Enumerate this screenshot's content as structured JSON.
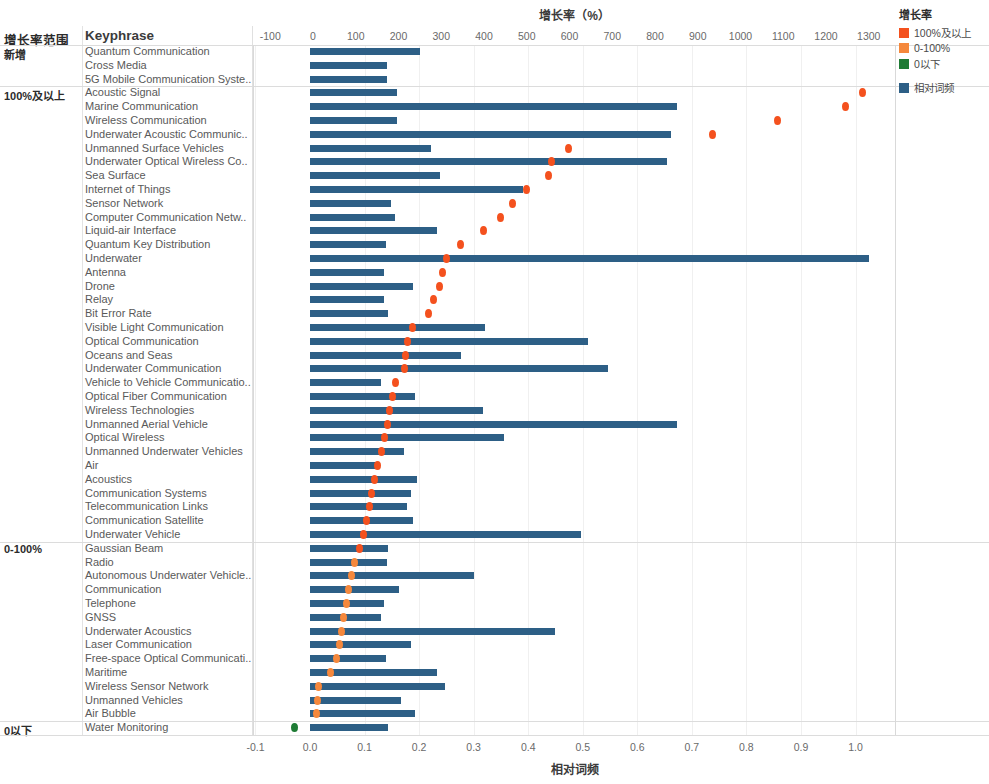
{
  "header": {
    "group_column_title": "增长率范围",
    "keyphrase_column_title": "Keyphrase",
    "top_axis_title": "增长率（%）",
    "bottom_axis_title": "相对词频"
  },
  "legend": {
    "title": "增长率",
    "items": [
      {
        "label": "100%及以上",
        "color": "#F4511E"
      },
      {
        "label": "0-100%",
        "color": "#F5883C"
      },
      {
        "label": "0以下",
        "color": "#1E7B34"
      }
    ],
    "bar_item": {
      "label": "相对词频",
      "color": "#2d5f86"
    }
  },
  "chart_data": {
    "type": "bar",
    "title": "增长率（%）",
    "xlabel": "相对词频",
    "ylabel": "Keyphrase",
    "secondary_xlabel": "增长率（%）",
    "grid": true,
    "legend_position": "right",
    "top_axis": {
      "label": "增长率（%）",
      "ticks": [
        -100,
        0,
        100,
        200,
        300,
        400,
        500,
        600,
        700,
        800,
        900,
        1000,
        1100,
        1200,
        1300
      ],
      "range": [
        -140,
        1345
      ]
    },
    "bottom_axis": {
      "label": "相对词频",
      "ticks": [
        "-0.1",
        "0.0",
        "0.1",
        "0.2",
        "0.3",
        "0.4",
        "0.5",
        "0.6",
        "0.7",
        "0.8",
        "0.9",
        "1.0"
      ],
      "range": [
        -0.107,
        1.075
      ]
    },
    "groups": [
      {
        "name": "新增",
        "count": 3
      },
      {
        "name": "100%及以上",
        "count": 33
      },
      {
        "name": "0-100%",
        "count": 13
      },
      {
        "name": "0以下",
        "count": 1
      }
    ],
    "series": [
      {
        "name": "相对词频",
        "type": "bar",
        "color": "#2d5f86"
      },
      {
        "name": "增长率",
        "type": "scatter",
        "colors": {
          "100%及以上": "#F4511E",
          "0-100%": "#F5883C",
          "0以下": "#1E7B34"
        }
      }
    ],
    "categories": [
      "Quantum Communication",
      "Cross Media",
      "5G Mobile Communication Syste..",
      "Acoustic Signal",
      "Marine Communication",
      "Wireless Communication",
      "Underwater Acoustic Communic..",
      "Unmanned Surface Vehicles",
      "Underwater Optical Wireless Co..",
      "Sea Surface",
      "Internet of Things",
      "Sensor Network",
      "Computer Communication Netw..",
      "Liquid-air Interface",
      "Quantum Key Distribution",
      "Underwater",
      "Antenna",
      "Drone",
      "Relay",
      "Bit Error Rate",
      "Visible Light Communication",
      "Optical Communication",
      "Oceans and Seas",
      "Underwater Communication",
      "Vehicle to Vehicle Communicatio..",
      "Optical Fiber Communication",
      "Wireless Technologies",
      "Unmanned Aerial Vehicle",
      "Optical Wireless",
      "Unmanned Underwater Vehicles",
      "Air",
      "Acoustics",
      "Communication Systems",
      "Telecommunication Links",
      "Communication Satellite",
      "Underwater Vehicle",
      "Gaussian Beam",
      "Radio",
      "Autonomous Underwater Vehicle..",
      "Communication",
      "Telephone",
      "GNSS",
      "Underwater Acoustics",
      "Laser Communication",
      "Free-space Optical Communicati..",
      "Maritime",
      "Wireless Sensor Network",
      "Unmanned Vehicles",
      "Air Bubble",
      "Water Monitoring"
    ],
    "rows": [
      {
        "keyphrase": "Quantum Communication",
        "group": "新增",
        "rel_freq": 0.202,
        "growth": null
      },
      {
        "keyphrase": "Cross Media",
        "group": "新增",
        "rel_freq": 0.142,
        "growth": null
      },
      {
        "keyphrase": "5G Mobile Communication Syste..",
        "group": "新增",
        "rel_freq": 0.141,
        "growth": null
      },
      {
        "keyphrase": "Acoustic Signal",
        "group": "100%及以上",
        "rel_freq": 0.16,
        "growth": 1285
      },
      {
        "keyphrase": "Marine Communication",
        "group": "100%及以上",
        "rel_freq": 0.672,
        "growth": 1246
      },
      {
        "keyphrase": "Wireless Communication",
        "group": "100%及以上",
        "rel_freq": 0.159,
        "growth": 1086
      },
      {
        "keyphrase": "Underwater Acoustic Communic..",
        "group": "100%及以上",
        "rel_freq": 0.662,
        "growth": 935
      },
      {
        "keyphrase": "Unmanned Surface Vehicles",
        "group": "100%及以上",
        "rel_freq": 0.222,
        "growth": 597
      },
      {
        "keyphrase": "Underwater Optical Wireless Co..",
        "group": "100%及以上",
        "rel_freq": 0.655,
        "growth": 557
      },
      {
        "keyphrase": "Sea Surface",
        "group": "100%及以上",
        "rel_freq": 0.238,
        "growth": 552
      },
      {
        "keyphrase": "Internet of Things",
        "group": "100%及以上",
        "rel_freq": 0.39,
        "growth": 500
      },
      {
        "keyphrase": "Sensor Network",
        "group": "100%及以上",
        "rel_freq": 0.148,
        "growth": 466
      },
      {
        "keyphrase": "Computer Communication Netw..",
        "group": "100%及以上",
        "rel_freq": 0.155,
        "growth": 438
      },
      {
        "keyphrase": "Liquid-air Interface",
        "group": "100%及以上",
        "rel_freq": 0.232,
        "growth": 398
      },
      {
        "keyphrase": "Quantum Key Distribution",
        "group": "100%及以上",
        "rel_freq": 0.14,
        "growth": 345
      },
      {
        "keyphrase": "Underwater",
        "group": "100%及以上",
        "rel_freq": 1.025,
        "growth": 313
      },
      {
        "keyphrase": "Antenna",
        "group": "100%及以上",
        "rel_freq": 0.135,
        "growth": 304
      },
      {
        "keyphrase": "Drone",
        "group": "100%及以上",
        "rel_freq": 0.188,
        "growth": 296
      },
      {
        "keyphrase": "Relay",
        "group": "100%及以上",
        "rel_freq": 0.136,
        "growth": 281
      },
      {
        "keyphrase": "Bit Error Rate",
        "group": "100%及以上",
        "rel_freq": 0.143,
        "growth": 270
      },
      {
        "keyphrase": "Visible Light Communication",
        "group": "100%及以上",
        "rel_freq": 0.32,
        "growth": 232
      },
      {
        "keyphrase": "Optical Communication",
        "group": "100%及以上",
        "rel_freq": 0.509,
        "growth": 222
      },
      {
        "keyphrase": "Oceans and Seas",
        "group": "100%及以上",
        "rel_freq": 0.276,
        "growth": 217
      },
      {
        "keyphrase": "Underwater Communication",
        "group": "100%及以上",
        "rel_freq": 0.546,
        "growth": 215
      },
      {
        "keyphrase": "Vehicle to Vehicle Communicatio..",
        "group": "100%及以上",
        "rel_freq": 0.13,
        "growth": 192
      },
      {
        "keyphrase": "Optical Fiber Communication",
        "group": "100%及以上",
        "rel_freq": 0.192,
        "growth": 186
      },
      {
        "keyphrase": "Wireless Technologies",
        "group": "100%及以上",
        "rel_freq": 0.318,
        "growth": 180
      },
      {
        "keyphrase": "Unmanned Aerial Vehicle",
        "group": "100%及以上",
        "rel_freq": 0.672,
        "growth": 175
      },
      {
        "keyphrase": "Optical Wireless",
        "group": "100%及以上",
        "rel_freq": 0.355,
        "growth": 168
      },
      {
        "keyphrase": "Unmanned Underwater Vehicles",
        "group": "100%及以上",
        "rel_freq": 0.173,
        "growth": 160
      },
      {
        "keyphrase": "Air",
        "group": "100%及以上",
        "rel_freq": 0.124,
        "growth": 150
      },
      {
        "keyphrase": "Acoustics",
        "group": "100%及以上",
        "rel_freq": 0.197,
        "growth": 145
      },
      {
        "keyphrase": "Communication Systems",
        "group": "100%及以上",
        "rel_freq": 0.185,
        "growth": 138
      },
      {
        "keyphrase": "Telecommunication Links",
        "group": "100%及以上",
        "rel_freq": 0.178,
        "growth": 133
      },
      {
        "keyphrase": "Communication Satellite",
        "group": "100%及以上",
        "rel_freq": 0.188,
        "growth": 125
      },
      {
        "keyphrase": "Underwater Vehicle",
        "group": "100%及以上",
        "rel_freq": 0.497,
        "growth": 118
      },
      {
        "keyphrase": "Gaussian Beam",
        "group": "100%及以上",
        "rel_freq": 0.143,
        "growth": 108
      },
      {
        "keyphrase": "Radio",
        "group": "0-100%",
        "rel_freq": 0.142,
        "growth": 98
      },
      {
        "keyphrase": "Autonomous Underwater Vehicle..",
        "group": "0-100%",
        "rel_freq": 0.3,
        "growth": 90
      },
      {
        "keyphrase": "Communication",
        "group": "0-100%",
        "rel_freq": 0.164,
        "growth": 84
      },
      {
        "keyphrase": "Telephone",
        "group": "0-100%",
        "rel_freq": 0.135,
        "growth": 78
      },
      {
        "keyphrase": "GNSS",
        "group": "0-100%",
        "rel_freq": 0.13,
        "growth": 72
      },
      {
        "keyphrase": "Underwater Acoustics",
        "group": "0-100%",
        "rel_freq": 0.45,
        "growth": 67
      },
      {
        "keyphrase": "Laser Communication",
        "group": "0-100%",
        "rel_freq": 0.186,
        "growth": 62
      },
      {
        "keyphrase": "Free-space Optical Communicati..",
        "group": "0-100%",
        "rel_freq": 0.139,
        "growth": 56
      },
      {
        "keyphrase": "Maritime",
        "group": "0-100%",
        "rel_freq": 0.232,
        "growth": 42
      },
      {
        "keyphrase": "Wireless Sensor Network",
        "group": "0-100%",
        "rel_freq": 0.247,
        "growth": 14
      },
      {
        "keyphrase": "Unmanned Vehicles",
        "group": "0-100%",
        "rel_freq": 0.166,
        "growth": 10
      },
      {
        "keyphrase": "Air Bubble",
        "group": "0-100%",
        "rel_freq": 0.192,
        "growth": 8
      },
      {
        "keyphrase": "Water Monitoring",
        "group": "0以下",
        "rel_freq": 0.143,
        "growth": -43
      }
    ]
  }
}
